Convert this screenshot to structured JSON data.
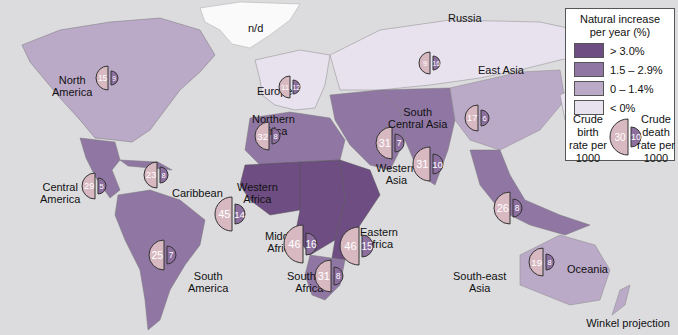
{
  "legend": {
    "title_line1": "Natural increase",
    "title_line2": "per year (%)",
    "classes": [
      {
        "label": "> 3.0%",
        "color": "#6e4d82"
      },
      {
        "label": "1.5 – 2.9%",
        "color": "#9077a3"
      },
      {
        "label": "0 – 1.4%",
        "color": "#bba9c8"
      },
      {
        "label": "< 0%",
        "color": "#e8e1ee"
      }
    ],
    "birth_label": [
      "Crude",
      "birth",
      "rate per",
      "1000"
    ],
    "death_label": [
      "Crude",
      "death",
      "rate per",
      "1000"
    ],
    "example_birth": "30",
    "example_death": "10"
  },
  "colors": {
    "ocean": "#dcdcdf",
    "birth_fill": "#d8b9c2",
    "death_fill": "#8d6f9f",
    "outline": "#333333",
    "no_data": "#ffffff"
  },
  "no_data_label": "n/d",
  "projection_label": "Winkel projection",
  "regions": [
    {
      "name": "North America",
      "lines": [
        "North",
        "America"
      ],
      "birth": 15,
      "death": 9,
      "lx": 52,
      "ly": 74,
      "gx": 108,
      "gy": 78,
      "r": 12
    },
    {
      "name": "Central America",
      "lines": [
        "Central",
        "America"
      ],
      "birth": 29,
      "death": 5,
      "lx": 40,
      "ly": 181,
      "gx": 95,
      "gy": 186,
      "r": 13
    },
    {
      "name": "Caribbean",
      "lines": [
        "Caribbean"
      ],
      "birth": 23,
      "death": 8,
      "lx": 172,
      "ly": 187,
      "gx": 157,
      "gy": 175,
      "r": 13
    },
    {
      "name": "South America",
      "lines": [
        "South",
        "America"
      ],
      "birth": 25,
      "death": 7,
      "lx": 188,
      "ly": 270,
      "gx": 164,
      "gy": 255,
      "r": 15
    },
    {
      "name": "Europe",
      "lines": [
        "Europe"
      ],
      "birth": 11,
      "death": 12,
      "lx": 257,
      "ly": 85,
      "gx": 290,
      "gy": 87,
      "r": 11
    },
    {
      "name": "Northern Africa",
      "lines": [
        "Northern",
        "Africa"
      ],
      "birth": 32,
      "death": 8,
      "lx": 252,
      "ly": 113,
      "gx": 269,
      "gy": 136,
      "r": 14
    },
    {
      "name": "Western Africa",
      "lines": [
        "Western",
        "Africa"
      ],
      "birth": 45,
      "death": 14,
      "lx": 237,
      "ly": 181,
      "gx": 232,
      "gy": 214,
      "r": 17
    },
    {
      "name": "Middle Africa",
      "lines": [
        "Middle",
        "Africa"
      ],
      "birth": 46,
      "death": 16,
      "lx": 265,
      "ly": 230,
      "gx": 303,
      "gy": 244,
      "r": 19
    },
    {
      "name": "Eastern Africa",
      "lines": [
        "Eastern",
        "Africa"
      ],
      "birth": 46,
      "death": 15,
      "lx": 360,
      "ly": 226,
      "gx": 359,
      "gy": 246,
      "r": 19
    },
    {
      "name": "Southern Africa",
      "lines": [
        "Southern",
        "Africa"
      ],
      "birth": 31,
      "death": 8,
      "lx": 287,
      "ly": 270,
      "gx": 331,
      "gy": 276,
      "r": 16
    },
    {
      "name": "Western Asia",
      "lines": [
        "Western",
        "Asia"
      ],
      "birth": 31,
      "death": 7,
      "lx": 376,
      "ly": 162,
      "gx": 392,
      "gy": 143,
      "r": 16
    },
    {
      "name": "South Central Asia",
      "lines": [
        "South",
        "Central Asia"
      ],
      "birth": 31,
      "death": 10,
      "lx": 388,
      "ly": 106,
      "gx": 430,
      "gy": 164,
      "r": 17
    },
    {
      "name": "Russia",
      "lines": [
        "Russia"
      ],
      "birth": 9,
      "death": 16,
      "lx": 448,
      "ly": 12,
      "gx": 430,
      "gy": 63,
      "r": 11
    },
    {
      "name": "East Asia",
      "lines": [
        "East Asia"
      ],
      "birth": 17,
      "death": 6,
      "lx": 478,
      "ly": 64,
      "gx": 478,
      "gy": 118,
      "r": 13
    },
    {
      "name": "South-east Asia",
      "lines": [
        "South-east",
        "Asia"
      ],
      "birth": 26,
      "death": 8,
      "lx": 453,
      "ly": 270,
      "gx": 510,
      "gy": 208,
      "r": 16
    },
    {
      "name": "Oceania",
      "lines": [
        "Oceania"
      ],
      "birth": 19,
      "death": 8,
      "lx": 567,
      "ly": 263,
      "gx": 543,
      "gy": 262,
      "r": 14
    }
  ],
  "chart_data": {
    "type": "map",
    "series": [
      {
        "name": "Crude birth rate per 1000",
        "values": {
          "North America": 15,
          "Central America": 29,
          "Caribbean": 23,
          "South America": 25,
          "Europe": 11,
          "Northern Africa": 32,
          "Western Africa": 45,
          "Middle Africa": 46,
          "Eastern Africa": 46,
          "Southern Africa": 31,
          "Western Asia": 31,
          "South Central Asia": 31,
          "Russia": 9,
          "East Asia": 17,
          "South-east Asia": 26,
          "Oceania": 19
        }
      },
      {
        "name": "Crude death rate per 1000",
        "values": {
          "North America": 9,
          "Central America": 5,
          "Caribbean": 8,
          "South America": 7,
          "Europe": 12,
          "Northern Africa": 8,
          "Western Africa": 14,
          "Middle Africa": 16,
          "Eastern Africa": 15,
          "Southern Africa": 8,
          "Western Asia": 7,
          "South Central Asia": 10,
          "Russia": 16,
          "East Asia": 6,
          "South-east Asia": 8,
          "Oceania": 8
        }
      }
    ],
    "legend": [
      "> 3.0%",
      "1.5 – 2.9%",
      "0 – 1.4%",
      "< 0%"
    ],
    "annotations": [
      "n/d (Greenland)",
      "Winkel projection"
    ]
  }
}
